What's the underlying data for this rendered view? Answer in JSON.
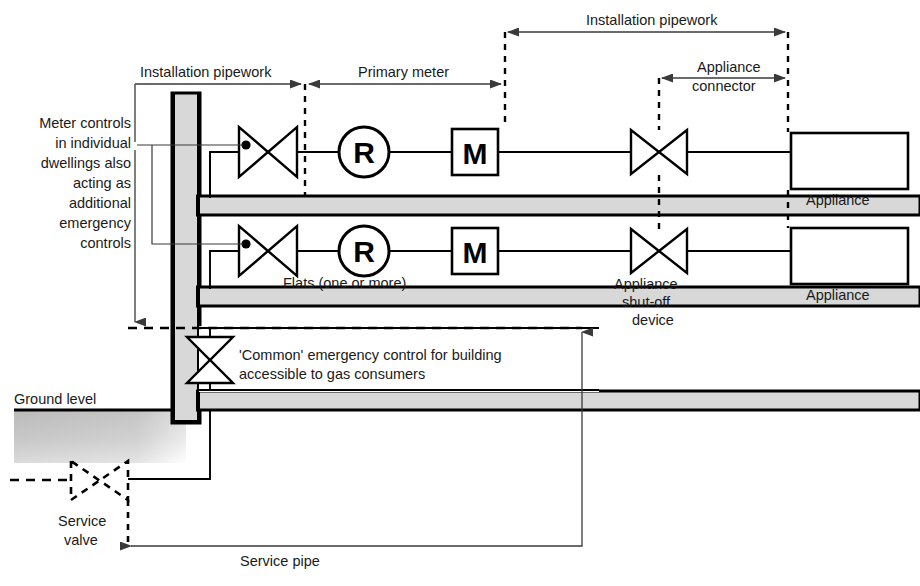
{
  "diagram": {
    "colors": {
      "pipe_fill": "#d8d8d8",
      "line": "#000000",
      "leader": "#3a3a3a",
      "ground_shade": "#c8c8c8",
      "background": "#ffffff"
    },
    "dimension_labels": {
      "installation_pipework_left": "Installation pipework",
      "primary_meter": "Primary meter",
      "installation_pipework_right": "Installation pipework",
      "appliance_connector_line1": "Appliance",
      "appliance_connector_line2": "connector"
    },
    "annotations": {
      "meter_controls": [
        "Meter controls",
        "in individual",
        "dwellings also",
        "acting as",
        "additional",
        "emergency",
        "controls"
      ],
      "flats": "Flats (one or more)",
      "common_control_line1": "'Common' emergency control for building",
      "common_control_line2": "accessible to gas consumers",
      "ground_level": "Ground level",
      "service_valve_line1": "Service",
      "service_valve_line2": "valve",
      "service_pipe": "Service pipe",
      "appliance_shutoff_line1": "Appliance",
      "appliance_shutoff_line2": "shut-off",
      "appliance_shutoff_line3": "device",
      "appliance_top": "Appliance",
      "appliance_bottom": "Appliance"
    },
    "symbols": {
      "regulator_letter": "R",
      "meter_letter": "M"
    }
  }
}
